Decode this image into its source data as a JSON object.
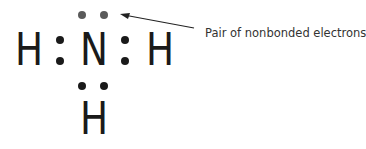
{
  "molecule": {
    "name": "ammonia lewis structure",
    "atoms": [
      "H",
      "N",
      "H",
      "H"
    ],
    "center": "N"
  },
  "annotation": {
    "label": "Pair of nonbonded electrons"
  },
  "colors": {
    "bond_dots": "#1a1a1a",
    "lone_pair_dots": "#5a5a5a"
  }
}
